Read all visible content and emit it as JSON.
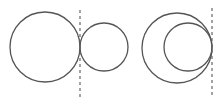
{
  "diagram": {
    "title": "",
    "stroke_color": "#555555",
    "tangent_line_color": "#666666",
    "figures": [
      {
        "name": "external-tangency",
        "circles": [
          {
            "cx": 45,
            "cy": 47,
            "r": 35
          },
          {
            "cx": 104,
            "cy": 47,
            "r": 24
          }
        ],
        "tangent_line": {
          "x": 80,
          "y1": 10,
          "y2": 97
        }
      },
      {
        "name": "internal-tangency",
        "circles": [
          {
            "cx": 177,
            "cy": 48,
            "r": 35
          },
          {
            "cx": 188,
            "cy": 47,
            "r": 24
          }
        ],
        "tangent_line": {
          "x": 212,
          "y1": 8,
          "y2": 95
        }
      }
    ]
  }
}
